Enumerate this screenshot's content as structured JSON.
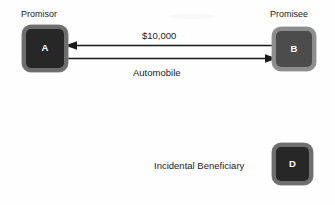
{
  "diagram": {
    "background_color": "#fefefe",
    "nodes": [
      {
        "id": "a",
        "letter": "A",
        "caption": "Promisor",
        "fill": "#272727",
        "border": "#6e6e6e",
        "shade": "dark"
      },
      {
        "id": "b",
        "letter": "B",
        "caption": "Promisee",
        "fill": "#4c4c4c",
        "border": "#8d8d8d",
        "shade": "mid"
      },
      {
        "id": "d",
        "letter": "D",
        "caption": "Incidental Beneficiary",
        "fill": "#272727",
        "border": "#6e6e6e",
        "shade": "dark"
      }
    ],
    "edges": [
      {
        "id": "payment",
        "label": "$10,000",
        "from": "B",
        "to": "A",
        "direction": "left",
        "color": "#1a1a1a"
      },
      {
        "id": "consideration",
        "label": "Automobile",
        "from": "A",
        "to": "B",
        "direction": "right",
        "color": "#1a1a1a"
      }
    ],
    "labels": {
      "promisor": "Promisor",
      "promisee": "Promisee",
      "amount": "$10,000",
      "consideration": "Automobile",
      "incidental_beneficiary": "Incidental Beneficiary",
      "letter_a": "A",
      "letter_b": "B",
      "letter_d": "D"
    }
  }
}
